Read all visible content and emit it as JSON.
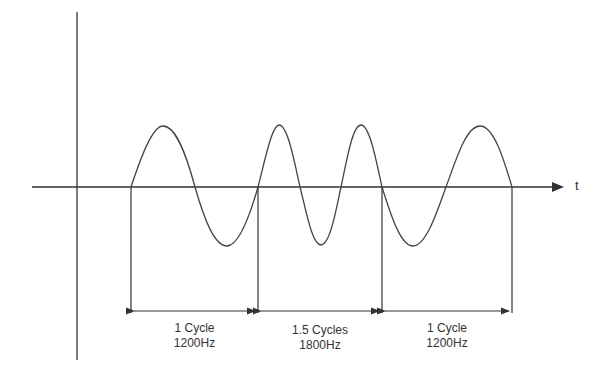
{
  "diagram": {
    "axis_label": "t",
    "segments": [
      {
        "cycles_label": "1 Cycle",
        "freq_label": "1200Hz"
      },
      {
        "cycles_label": "1.5 Cycles",
        "freq_label": "1800Hz"
      },
      {
        "cycles_label": "1 Cycle",
        "freq_label": "1200Hz"
      }
    ],
    "colors": {
      "line": "#333333",
      "background": "#ffffff"
    }
  }
}
